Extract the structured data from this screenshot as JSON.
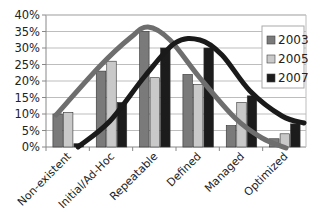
{
  "chart_data": {
    "type": "bar",
    "title": "",
    "xlabel": "",
    "ylabel": "",
    "ylim": [
      0,
      40
    ],
    "y_ticks": [
      "0%",
      "5%",
      "10%",
      "15%",
      "20%",
      "25%",
      "30%",
      "35%",
      "40%"
    ],
    "grid": true,
    "legend_position": "upper-right-inside",
    "categories": [
      "Non-existent",
      "Initial/Ad-Hoc",
      "Repeatable",
      "Defined",
      "Managed",
      "Optimized"
    ],
    "series": [
      {
        "name": "2003",
        "color": "#7a7a7a",
        "values": [
          10,
          23,
          35,
          22,
          6.5,
          2.5
        ]
      },
      {
        "name": "2005",
        "color": "#c9c9c9",
        "values": [
          10.5,
          26,
          21,
          19,
          13.5,
          4
        ]
      },
      {
        "name": "2007",
        "color": "#1c1c1c",
        "values": [
          1,
          13.5,
          30,
          30,
          15.5,
          7
        ]
      }
    ],
    "overlays": [
      {
        "type": "trend-curve",
        "follows": "2003",
        "color": "#6e6e6e",
        "description": "smooth bell curve peaking near Repeatable"
      },
      {
        "type": "trend-curve",
        "follows": "2007",
        "color": "#1a1a1a",
        "description": "smooth bell curve peaking between Repeatable and Defined"
      }
    ]
  },
  "legend": {
    "items": [
      {
        "label": "2003",
        "color": "#7a7a7a"
      },
      {
        "label": "2005",
        "color": "#c9c9c9"
      },
      {
        "label": "2007",
        "color": "#1c1c1c"
      }
    ]
  }
}
